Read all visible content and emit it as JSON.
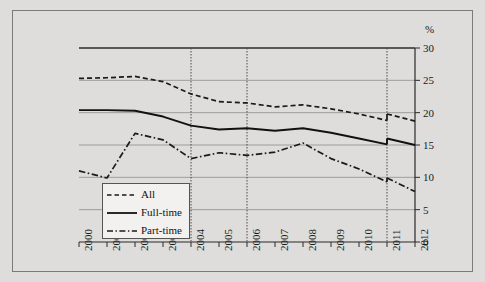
{
  "chart_data": {
    "type": "line",
    "title": "",
    "subtitle": "",
    "xlabel": "",
    "ylabel": "%",
    "xlim": [
      2000,
      2012
    ],
    "ylim": [
      0,
      30
    ],
    "ytick_values": [
      0,
      5,
      10,
      15,
      20,
      25,
      30
    ],
    "ytick_labels": [
      "0",
      "5",
      "10",
      "15",
      "20",
      "25",
      "30"
    ],
    "grid": "horizontal-gridlines-plus-vertical-break-lines",
    "vertical_break_years": [
      2004,
      2006,
      2011
    ],
    "legend_position": "lower-left-inside",
    "x": [
      2000,
      2001,
      2002,
      2003,
      2004,
      2005,
      2006,
      2007,
      2008,
      2009,
      2010,
      2011,
      2012
    ],
    "categories": [
      "2000",
      "2001",
      "2002",
      "2003",
      "2004",
      "2005",
      "2006",
      "2007",
      "2008",
      "2009",
      "2010",
      "2011",
      "2012"
    ],
    "series": [
      {
        "name": "All",
        "style": "dashed",
        "color": "#1a1a1a",
        "values": [
          25.3,
          25.4,
          25.6,
          24.8,
          22.9,
          21.7,
          21.5,
          20.9,
          21.2,
          20.6,
          19.8,
          18.8,
          18.7
        ],
        "break_at": 2011,
        "break_value_after": 19.8
      },
      {
        "name": "Full-time",
        "style": "solid",
        "color": "#111111",
        "values": [
          20.4,
          20.4,
          20.3,
          19.4,
          18.0,
          17.4,
          17.6,
          17.2,
          17.6,
          16.9,
          16.0,
          15.1,
          15.0
        ],
        "break_at": 2011,
        "break_value_after": 16.0
      },
      {
        "name": "Part-time",
        "style": "dash-dot",
        "color": "#1a1a1a",
        "values": [
          11.0,
          9.9,
          16.8,
          15.8,
          12.9,
          13.8,
          13.4,
          13.9,
          15.3,
          12.9,
          11.3,
          9.3,
          7.8
        ],
        "break_at": 2011,
        "break_value_after": 9.9
      }
    ]
  },
  "axis": {
    "unit_label": "%",
    "y_labels": [
      "30",
      "25",
      "20",
      "15",
      "10",
      "5",
      "0"
    ],
    "x_labels": [
      "2000",
      "2001",
      "2002",
      "2003",
      "2004",
      "2005",
      "2006",
      "2007",
      "2008",
      "2009",
      "2010",
      "2011",
      "2012"
    ]
  },
  "legend": {
    "items": [
      {
        "label": "All",
        "style": "dashed"
      },
      {
        "label": "Full-time",
        "style": "solid"
      },
      {
        "label": "Part-time",
        "style": "dash-dot"
      }
    ]
  }
}
